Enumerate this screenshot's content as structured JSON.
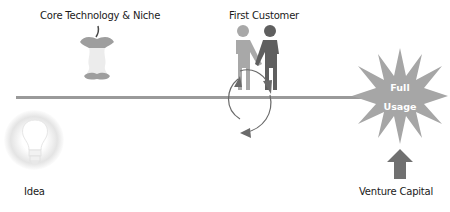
{
  "diagram": {
    "title": "",
    "stages": [
      {
        "id": "idea",
        "label": "Idea",
        "icon": "lightbulb-icon"
      },
      {
        "id": "core",
        "label": "Core Technology & Niche",
        "icon": "apple-core-icon"
      },
      {
        "id": "customer",
        "label": "First Customer",
        "icon": "handshake-icon"
      },
      {
        "id": "full",
        "label_line1": "Full",
        "label_line2": "Usage",
        "icon": "starburst-icon"
      },
      {
        "id": "vc",
        "label": "Venture Capital",
        "icon": "arrow-up-icon"
      }
    ],
    "cycle": {
      "icon": "cycle-arrows-icon"
    },
    "colors": {
      "timeline": "#9a9a9a",
      "apple": "#9e9e9e",
      "apple_core": "#ececec",
      "person_left": "#a8a8a8",
      "person_right": "#5f5f5f",
      "star": "#a6a6a6",
      "arrow": "#707070",
      "cycle": "#6a6a6a",
      "bulb_glow": "#e0e0e0"
    }
  }
}
